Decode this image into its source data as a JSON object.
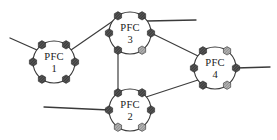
{
  "diagram": {
    "canvas": {
      "width": 277,
      "height": 140,
      "background": "#ffffff"
    },
    "style": {
      "node_stroke": "#3a3a3a",
      "node_fill": "#ffffff",
      "link_stroke": "#3d3d3d",
      "port_fill_dark": "#4a4a4a",
      "port_fill_light": "#8c8c8c",
      "port_stroke": "#222222",
      "text_color": "#1a1a1a"
    },
    "nodes": [
      {
        "id": "pfc1",
        "label": "PFC",
        "index": "1",
        "cx": 54,
        "cy": 62,
        "r": 21,
        "label_dy": -4,
        "index_dy": 8,
        "ports": [
          {
            "name": "port-top-left",
            "angle": 235,
            "fill": "dark"
          },
          {
            "name": "port-left",
            "angle": 180,
            "fill": "dark"
          },
          {
            "name": "port-bottom-left",
            "angle": 125,
            "fill": "dark"
          },
          {
            "name": "port-bottom-right",
            "angle": 55,
            "fill": "dark"
          },
          {
            "name": "port-right",
            "angle": 0,
            "fill": "dark"
          },
          {
            "name": "port-top-right",
            "angle": 305,
            "fill": "dark"
          }
        ]
      },
      {
        "id": "pfc3",
        "label": "PFC",
        "index": "3",
        "cx": 130,
        "cy": 33,
        "r": 21,
        "label_dy": -4,
        "index_dy": 8,
        "ports": [
          {
            "name": "port-top-left",
            "angle": 235,
            "fill": "dark"
          },
          {
            "name": "port-left",
            "angle": 180,
            "fill": "dark"
          },
          {
            "name": "port-bottom-left",
            "angle": 125,
            "fill": "dark"
          },
          {
            "name": "port-bottom-right",
            "angle": 55,
            "fill": "light"
          },
          {
            "name": "port-right",
            "angle": 0,
            "fill": "dark"
          },
          {
            "name": "port-top-right",
            "angle": 305,
            "fill": "dark"
          }
        ]
      },
      {
        "id": "pfc2",
        "label": "PFC",
        "index": "2",
        "cx": 130,
        "cy": 110,
        "r": 21,
        "label_dy": -4,
        "index_dy": 8,
        "ports": [
          {
            "name": "port-top-left",
            "angle": 235,
            "fill": "dark"
          },
          {
            "name": "port-left",
            "angle": 180,
            "fill": "dark"
          },
          {
            "name": "port-bottom-left",
            "angle": 125,
            "fill": "light"
          },
          {
            "name": "port-bottom-right",
            "angle": 55,
            "fill": "light"
          },
          {
            "name": "port-right",
            "angle": 0,
            "fill": "dark"
          },
          {
            "name": "port-top-right",
            "angle": 305,
            "fill": "dark"
          }
        ]
      },
      {
        "id": "pfc4",
        "label": "PFC",
        "index": "4",
        "cx": 215,
        "cy": 68,
        "r": 21,
        "label_dy": -4,
        "index_dy": 8,
        "ports": [
          {
            "name": "port-top-left",
            "angle": 235,
            "fill": "dark"
          },
          {
            "name": "port-left",
            "angle": 180,
            "fill": "dark"
          },
          {
            "name": "port-bottom-left",
            "angle": 125,
            "fill": "dark"
          },
          {
            "name": "port-bottom-right",
            "angle": 55,
            "fill": "light"
          },
          {
            "name": "port-right",
            "angle": 0,
            "fill": "dark"
          },
          {
            "name": "port-top-right",
            "angle": 305,
            "fill": "light"
          }
        ]
      }
    ],
    "links": [
      {
        "name": "link-pfc1-pfc3",
        "from": "pfc1",
        "to": "pfc3",
        "x1": 71,
        "y1": 50,
        "x2": 113,
        "y2": 21
      },
      {
        "name": "link-pfc3-pfc2",
        "from": "pfc3",
        "to": "pfc2",
        "x1": 118,
        "y1": 45,
        "x2": 118,
        "y2": 98
      },
      {
        "name": "link-pfc3-pfc4",
        "from": "pfc3",
        "to": "pfc4",
        "x1": 151,
        "y1": 33,
        "x2": 198,
        "y2": 56
      },
      {
        "name": "link-pfc2-pfc4",
        "from": "pfc2",
        "to": "pfc4",
        "x1": 143,
        "y1": 98,
        "x2": 198,
        "y2": 80
      }
    ],
    "external_links": [
      {
        "name": "ext-link-pfc1-upleft",
        "node": "pfc1",
        "x1": 37,
        "y1": 50,
        "x2": 10,
        "y2": 38
      },
      {
        "name": "ext-link-pfc3-right",
        "node": "pfc3",
        "x1": 147,
        "y1": 21,
        "x2": 196,
        "y2": 20
      },
      {
        "name": "ext-link-pfc2-left",
        "node": "pfc2",
        "x1": 109,
        "y1": 110,
        "x2": 44,
        "y2": 107
      },
      {
        "name": "ext-link-pfc4-right",
        "node": "pfc4",
        "x1": 236,
        "y1": 68,
        "x2": 270,
        "y2": 67
      }
    ]
  }
}
